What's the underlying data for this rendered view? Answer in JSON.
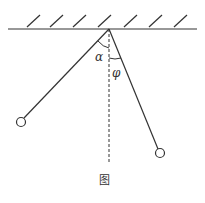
{
  "diagram": {
    "caption": "图",
    "angle_left_label": "α",
    "angle_right_label": "φ",
    "colors": {
      "line": "#333333",
      "background": "#ffffff"
    },
    "elements": [
      "ceiling",
      "vertical-dashed-reference",
      "left-pendulum",
      "right-pendulum"
    ]
  }
}
